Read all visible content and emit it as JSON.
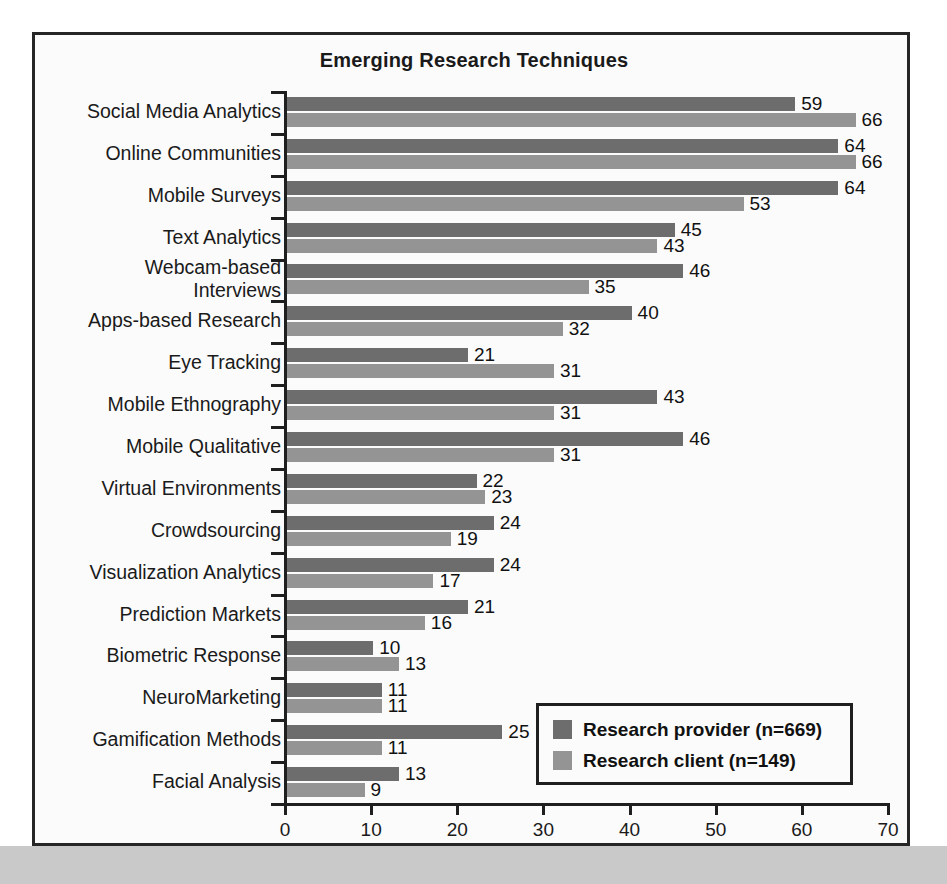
{
  "figure": {
    "title": "Emerging Research Techniques"
  },
  "legend": {
    "position": "bottom-right",
    "entries": [
      {
        "label": "Research provider (n=669)",
        "color": "#6d6d6d",
        "key": "provider"
      },
      {
        "label": "Research client (n=149)",
        "color": "#949494",
        "key": "client"
      }
    ]
  },
  "axis": {
    "x_ticks": [
      "0",
      "10",
      "20",
      "30",
      "40",
      "50",
      "60",
      "70"
    ],
    "xlim": [
      0,
      70
    ]
  },
  "chart_data": {
    "type": "bar",
    "orientation": "horizontal",
    "title": "Emerging Research Techniques",
    "xlabel": "",
    "ylabel": "",
    "xlim": [
      0,
      70
    ],
    "xticks": [
      0,
      10,
      20,
      30,
      40,
      50,
      60,
      70
    ],
    "grid": false,
    "legend_position": "bottom-right",
    "categories": [
      "Social Media Analytics",
      "Online Communities",
      "Mobile Surveys",
      "Text Analytics",
      "Webcam-based\nInterviews",
      "Apps-based Research",
      "Eye Tracking",
      "Mobile Ethnography",
      "Mobile Qualitative",
      "Virtual Environments",
      "Crowdsourcing",
      "Visualization Analytics",
      "Prediction Markets",
      "Biometric Response",
      "NeuroMarketing",
      "Gamification Methods",
      "Facial Analysis"
    ],
    "series": [
      {
        "name": "Research provider (n=669)",
        "color": "#6d6d6d",
        "values": [
          59,
          64,
          64,
          45,
          46,
          40,
          21,
          43,
          46,
          22,
          24,
          24,
          21,
          10,
          11,
          25,
          13
        ]
      },
      {
        "name": "Research client (n=149)",
        "color": "#949494",
        "values": [
          66,
          66,
          53,
          43,
          35,
          32,
          31,
          31,
          31,
          23,
          19,
          17,
          16,
          13,
          11,
          11,
          9
        ]
      }
    ]
  }
}
